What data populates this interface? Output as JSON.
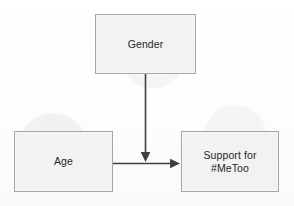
{
  "diagram": {
    "background_color": "#ffffff",
    "node_fill_color": "#f2f2f2",
    "node_border_color": "#a6a6a6",
    "arrow_color": "#404040",
    "nodes": [
      {
        "id": "gender",
        "label": "Gender"
      },
      {
        "id": "age",
        "label": "Age"
      },
      {
        "id": "outcome",
        "label": "Support for\n#MeToo"
      }
    ],
    "edges": [
      {
        "id": "gender-to-outcome",
        "from": "Gender",
        "to": "Support for #MeToo",
        "direction": "down",
        "label": ""
      },
      {
        "id": "age-to-outcome",
        "from": "Age",
        "to": "Support for #MeToo",
        "direction": "right",
        "label": ""
      }
    ]
  }
}
